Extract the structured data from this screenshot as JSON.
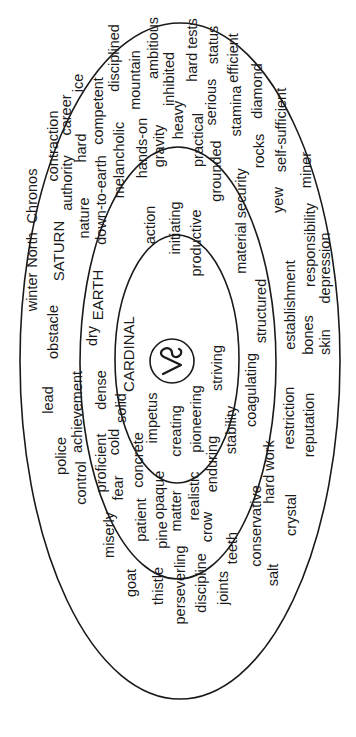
{
  "diagram": {
    "orientation": "rotated -90 (text reads bottom-to-top)",
    "colors": {
      "stroke": "#1a1a1a",
      "text": "#1a1a1a",
      "background": "#ffffff"
    },
    "symbol": {
      "name": "capricorn-glyph",
      "unicode": "♑"
    },
    "rings": [
      {
        "id": "outer",
        "label": "SATURN",
        "words": [
          {
            "t": "winter",
            "x": 37,
            "y": 292
          },
          {
            "t": "North",
            "x": 37,
            "y": 250
          },
          {
            "t": "Chronos",
            "x": 37,
            "y": 196
          },
          {
            "t": "lead",
            "x": 53,
            "y": 400
          },
          {
            "t": "obstacle",
            "x": 58,
            "y": 332
          },
          {
            "t": "SATURN",
            "x": 64,
            "y": 251
          },
          {
            "t": "contraction",
            "x": 58,
            "y": 146
          },
          {
            "t": "police",
            "x": 66,
            "y": 456
          },
          {
            "t": "achievement",
            "x": 82,
            "y": 412
          },
          {
            "t": "authority",
            "x": 72,
            "y": 183
          },
          {
            "t": "career",
            "x": 71,
            "y": 115
          },
          {
            "t": "ice",
            "x": 83,
            "y": 83
          },
          {
            "t": "control",
            "x": 86,
            "y": 483
          },
          {
            "t": "proficient",
            "x": 106,
            "y": 463
          },
          {
            "t": "hard",
            "x": 86,
            "y": 148
          },
          {
            "t": "competent",
            "x": 103,
            "y": 111
          },
          {
            "t": "disciplined",
            "x": 119,
            "y": 58
          },
          {
            "t": "miserly",
            "x": 114,
            "y": 535
          },
          {
            "t": "fear",
            "x": 123,
            "y": 488
          },
          {
            "t": "mountain",
            "x": 140,
            "y": 80
          },
          {
            "t": "ambitious",
            "x": 158,
            "y": 48
          },
          {
            "t": "goat",
            "x": 136,
            "y": 583
          },
          {
            "t": "patient",
            "x": 146,
            "y": 520
          },
          {
            "t": "inhibited",
            "x": 174,
            "y": 79
          },
          {
            "t": "hard tests",
            "x": 197,
            "y": 50
          },
          {
            "t": "thistle",
            "x": 163,
            "y": 586
          },
          {
            "t": "pine",
            "x": 167,
            "y": 535
          },
          {
            "t": "serious",
            "x": 216,
            "y": 102
          },
          {
            "t": "status",
            "x": 218,
            "y": 45
          },
          {
            "t": "perseverling",
            "x": 185,
            "y": 585
          },
          {
            "t": "stamina",
            "x": 241,
            "y": 111
          },
          {
            "t": "efficient",
            "x": 238,
            "y": 58
          },
          {
            "t": "discipline",
            "x": 206,
            "y": 583
          },
          {
            "t": "crow",
            "x": 212,
            "y": 527
          },
          {
            "t": "rocks",
            "x": 264,
            "y": 151
          },
          {
            "t": "diamond",
            "x": 262,
            "y": 91
          },
          {
            "t": "joints",
            "x": 228,
            "y": 588
          },
          {
            "t": "teeth",
            "x": 237,
            "y": 548
          },
          {
            "t": "hard work",
            "x": 274,
            "y": 472
          },
          {
            "t": "yew",
            "x": 283,
            "y": 200
          },
          {
            "t": "self-sufficient",
            "x": 286,
            "y": 130
          },
          {
            "t": "conservative",
            "x": 261,
            "y": 526
          },
          {
            "t": "restriction",
            "x": 294,
            "y": 418
          },
          {
            "t": "establishment",
            "x": 295,
            "y": 305
          },
          {
            "t": "salt",
            "x": 278,
            "y": 575
          },
          {
            "t": "crystal",
            "x": 296,
            "y": 515
          },
          {
            "t": "reputation",
            "x": 314,
            "y": 425
          },
          {
            "t": "bones",
            "x": 313,
            "y": 335
          },
          {
            "t": "responsibility",
            "x": 315,
            "y": 245
          },
          {
            "t": "miner",
            "x": 311,
            "y": 170
          },
          {
            "t": "skin",
            "x": 330,
            "y": 342
          },
          {
            "t": "depression",
            "x": 330,
            "y": 268
          }
        ]
      },
      {
        "id": "middle",
        "label": "EARTH",
        "words": [
          {
            "t": "dry",
            "x": 97,
            "y": 336
          },
          {
            "t": "EARTH",
            "x": 103,
            "y": 295
          },
          {
            "t": "nature",
            "x": 89,
            "y": 218
          },
          {
            "t": "down-to-earth",
            "x": 106,
            "y": 200
          },
          {
            "t": "dense",
            "x": 106,
            "y": 390
          },
          {
            "t": "melancholic",
            "x": 124,
            "y": 160
          },
          {
            "t": "solid",
            "x": 126,
            "y": 408
          },
          {
            "t": "cold",
            "x": 119,
            "y": 442
          },
          {
            "t": "hands-on",
            "x": 147,
            "y": 148
          },
          {
            "t": "concrete",
            "x": 143,
            "y": 460
          },
          {
            "t": "gravity",
            "x": 164,
            "y": 146
          },
          {
            "t": "opaque",
            "x": 164,
            "y": 495
          },
          {
            "t": "heavy",
            "x": 183,
            "y": 120
          },
          {
            "t": "matter",
            "x": 181,
            "y": 511
          },
          {
            "t": "practical",
            "x": 203,
            "y": 140
          },
          {
            "t": "realistic",
            "x": 199,
            "y": 496
          },
          {
            "t": "grounded",
            "x": 221,
            "y": 171
          },
          {
            "t": "enduring",
            "x": 217,
            "y": 464
          },
          {
            "t": "material security",
            "x": 246,
            "y": 221
          },
          {
            "t": "stability",
            "x": 236,
            "y": 430
          },
          {
            "t": "coagulating",
            "x": 256,
            "y": 390
          },
          {
            "t": "structured",
            "x": 266,
            "y": 311
          }
        ]
      },
      {
        "id": "inner",
        "label": "CARDINAL",
        "words": [
          {
            "t": "action",
            "x": 155,
            "y": 225
          },
          {
            "t": "CARDINAL",
            "x": 134,
            "y": 354
          },
          {
            "t": "impetus",
            "x": 157,
            "y": 418
          },
          {
            "t": "initiating",
            "x": 180,
            "y": 228
          },
          {
            "t": "creating",
            "x": 181,
            "y": 431
          },
          {
            "t": "productive",
            "x": 201,
            "y": 243
          },
          {
            "t": "pioneering",
            "x": 201,
            "y": 419
          },
          {
            "t": "striving",
            "x": 222,
            "y": 368
          }
        ]
      }
    ]
  }
}
